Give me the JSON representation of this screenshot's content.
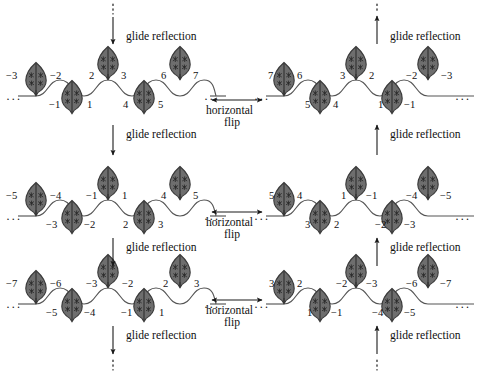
{
  "figure": {
    "motif_name": "leaf-motif",
    "colors": {
      "motif_fill": "#6e6e6e",
      "motif_stroke": "#3a3a3a",
      "curve_stroke": "#555555",
      "arrow_stroke": "#1a1a1a",
      "text": "#111111",
      "background": "#ffffff"
    }
  },
  "operations": {
    "glide_reflection": "glide reflection",
    "horizontal_flip_line1": "horizontal",
    "horizontal_flip_line2": "flip",
    "ellipsis": "···"
  },
  "arrows": {
    "top_left": {
      "label": "glide reflection",
      "direction": "down",
      "dashed_end": "top"
    },
    "top_right": {
      "label": "glide reflection",
      "direction": "up",
      "dashed_end": "top"
    },
    "mid1_left": {
      "label": "glide reflection",
      "direction": "down",
      "dashed_end": "none"
    },
    "mid1_right": {
      "label": "glide reflection",
      "direction": "up",
      "dashed_end": "none"
    },
    "mid2_left": {
      "label": "glide reflection",
      "direction": "down",
      "dashed_end": "none"
    },
    "mid2_right": {
      "label": "glide reflection",
      "direction": "up",
      "dashed_end": "none"
    },
    "bottom_left": {
      "label": "glide reflection",
      "direction": "down",
      "dashed_end": "bottom"
    },
    "bottom_right": {
      "label": "glide reflection",
      "direction": "up",
      "dashed_end": "bottom"
    },
    "flip_row1": {
      "label_line1": "horizontal",
      "label_line2": "flip",
      "direction": "both"
    },
    "flip_row2": {
      "label_line1": "horizontal",
      "label_line2": "flip",
      "direction": "both"
    },
    "flip_row3": {
      "label_line1": "horizontal",
      "label_line2": "flip",
      "direction": "both"
    }
  },
  "rows": [
    {
      "id": "row-1",
      "left_panel": {
        "id": "panel-1-left",
        "upper_labels": [
          "−3",
          "−2",
          "2",
          "3",
          "6",
          "7"
        ],
        "lower_labels": [
          "−1",
          "1",
          "4",
          "5"
        ],
        "lead_ellipsis": "···",
        "trail_ellipsis": "···"
      },
      "right_panel": {
        "id": "panel-1-right",
        "upper_labels": [
          "7",
          "6",
          "3",
          "2",
          "−2",
          "−3"
        ],
        "lower_labels": [
          "5",
          "4",
          "1",
          "−1"
        ],
        "lead_ellipsis": "···",
        "trail_ellipsis": "···"
      }
    },
    {
      "id": "row-2",
      "left_panel": {
        "id": "panel-2-left",
        "upper_labels": [
          "−5",
          "−4",
          "−1",
          "1",
          "4",
          "5"
        ],
        "lower_labels": [
          "−3",
          "−2",
          "2",
          "3"
        ],
        "lead_ellipsis": "···",
        "trail_ellipsis": "···"
      },
      "right_panel": {
        "id": "panel-2-right",
        "upper_labels": [
          "5",
          "4",
          "1",
          "−1",
          "−4",
          "−5"
        ],
        "lower_labels": [
          "3",
          "2",
          "−2",
          "−3"
        ],
        "lead_ellipsis": "···",
        "trail_ellipsis": "···"
      }
    },
    {
      "id": "row-3",
      "left_panel": {
        "id": "panel-3-left",
        "upper_labels": [
          "−7",
          "−6",
          "−3",
          "−2",
          "2",
          "3"
        ],
        "lower_labels": [
          "−5",
          "−4",
          "−1",
          "1"
        ],
        "lead_ellipsis": "···",
        "trail_ellipsis": "···"
      },
      "right_panel": {
        "id": "panel-3-right",
        "upper_labels": [
          "3",
          "2",
          "−2",
          "−3",
          "−6",
          "−7"
        ],
        "lower_labels": [
          "1",
          "−1",
          "−4",
          "−5"
        ],
        "lead_ellipsis": "···",
        "trail_ellipsis": "···"
      }
    }
  ]
}
